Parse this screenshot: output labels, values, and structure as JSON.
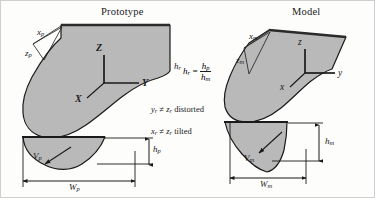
{
  "figure": {
    "background_color": "#fdfdfc",
    "shape_fill_color": "#b9b9b9",
    "outline_color": "#1a1a1a"
  },
  "prototype": {
    "title": "Prototype",
    "axes": {
      "x": "X",
      "y": "Y",
      "z": "Z"
    },
    "edge_labels": {
      "x": "x",
      "x_sub": "p",
      "z": "z",
      "z_sub": "p"
    },
    "dimensions": {
      "width_symbol": "W",
      "width_sub": "p",
      "height_symbol": "h",
      "height_sub": "p",
      "volume_symbol": "V",
      "volume_sub": "p"
    }
  },
  "model": {
    "title": "Model",
    "axes": {
      "x": "x",
      "y": "y",
      "z": "z"
    },
    "edge_labels": {
      "x": "x",
      "x_sub": "m",
      "z": "z",
      "z_sub": "m"
    },
    "dimensions": {
      "width_symbol": "W",
      "width_sub": "m",
      "height_symbol": "h",
      "height_sub": "m",
      "volume_symbol": "V",
      "volume_sub": "m"
    }
  },
  "annotations": {
    "ratio_lhs": "h",
    "ratio_lhs_sub": "r",
    "ratio_equals": "=",
    "ratio_num": "h",
    "ratio_num_sub": "p",
    "ratio_den": "h",
    "ratio_den_sub": "m",
    "hr_marker": "h",
    "hr_marker_sub": "r",
    "note_distorted_y": "y",
    "note_distorted_y_sub": "r",
    "note_distorted_neq": "≠",
    "note_distorted_z": "z",
    "note_distorted_z_sub": "r",
    "note_distorted_word": "distorted",
    "note_tilted_x": "x",
    "note_tilted_x_sub": "r",
    "note_tilted_neq": "≠",
    "note_tilted_z": "z",
    "note_tilted_z_sub": "r",
    "note_tilted_word": "tilted"
  }
}
